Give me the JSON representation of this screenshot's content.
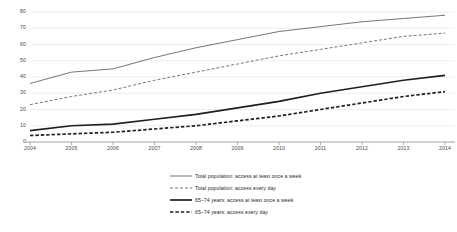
{
  "chart_data": {
    "type": "line",
    "title": "",
    "subtitle": "",
    "xlabel": "",
    "ylabel": "",
    "x": [
      "2004",
      "2005",
      "2006",
      "2007",
      "2008",
      "2009",
      "2010",
      "2011",
      "2012",
      "2013",
      "2014"
    ],
    "categories": [
      "2004",
      "2005",
      "2006",
      "2007",
      "2008",
      "2009",
      "2010",
      "2011",
      "2012",
      "2013",
      "2014"
    ],
    "xlim": [
      2004,
      2014
    ],
    "ylim": [
      0,
      80
    ],
    "yticks": [
      0,
      10,
      20,
      30,
      40,
      50,
      60,
      70,
      80
    ],
    "ytick_labels": [
      "0",
      "10",
      "20",
      "30",
      "40",
      "50",
      "60",
      "70",
      "80"
    ],
    "xtick_labels": [
      "2004",
      "2005",
      "2006",
      "2007",
      "2008",
      "2009",
      "2010",
      "2011",
      "2012",
      "2013",
      "2014"
    ],
    "grid": true,
    "grid_axis": "y",
    "legend_position": "bottom",
    "series": [
      {
        "name": "Total population: access at least once a week",
        "style": "solid",
        "width": "thin",
        "color": "#6e6e6e",
        "values": [
          36,
          43,
          45,
          52,
          58,
          63,
          68,
          71,
          74,
          76,
          78
        ]
      },
      {
        "name": "Total population: access every day",
        "style": "dashed",
        "width": "thin",
        "color": "#6e6e6e",
        "values": [
          23,
          28,
          32,
          38,
          43,
          48,
          53,
          57,
          61,
          65,
          67
        ]
      },
      {
        "name": "65–74 years: access at least once a week",
        "style": "solid",
        "width": "thick",
        "color": "#1f1f1f",
        "values": [
          7,
          10,
          11,
          14,
          17,
          21,
          25,
          30,
          34,
          38,
          41
        ]
      },
      {
        "name": "65–74 years: access every day",
        "style": "dashed",
        "width": "thick",
        "color": "#1f1f1f",
        "values": [
          4,
          5,
          6,
          8,
          10,
          13,
          16,
          20,
          24,
          28,
          31
        ]
      }
    ]
  },
  "legend": {
    "items": [
      {
        "label": "Total population: access at least once a week"
      },
      {
        "label": "Total population: access every day"
      },
      {
        "label": "65–74 years: access at least once a week"
      },
      {
        "label": "65–74 years: access every day"
      }
    ]
  },
  "colors": {
    "grid": "#e2e2e2",
    "axis": "#8a8a8a",
    "series_light": "#6e6e6e",
    "series_dark": "#1f1f1f",
    "text": "#4a4a4a",
    "background": "#ffffff"
  }
}
